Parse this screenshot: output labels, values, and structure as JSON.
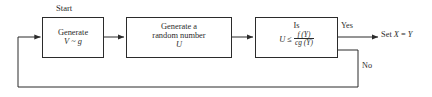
{
  "diagram": {
    "title_caption": "Start",
    "nodes": [
      {
        "id": "generate-y",
        "lines": [
          "Generate",
          "V ~ g"
        ],
        "line1": "Generate",
        "line2_var": "V",
        "line2_rel": "~",
        "line2_dist": "g"
      },
      {
        "id": "generate-u",
        "line1": "Generate a",
        "line2": "random number",
        "line3": "U"
      },
      {
        "id": "decision",
        "line1": "Is",
        "lhs": "U",
        "operator": "≤",
        "numerator": "f (Y)",
        "denominator": "cg (Y)"
      }
    ],
    "edges": [
      {
        "id": "yes-branch",
        "label": "Yes"
      },
      {
        "id": "no-branch",
        "label": "No"
      }
    ],
    "outputs": [
      {
        "id": "set-x",
        "prefix": "Set",
        "var_x": "X",
        "equals": "=",
        "var_y": "Y",
        "text": "Set X = Y"
      }
    ],
    "colors": {
      "stroke": "#2b2b2b",
      "text": "#2b2b2b",
      "background": "#ffffff"
    }
  }
}
